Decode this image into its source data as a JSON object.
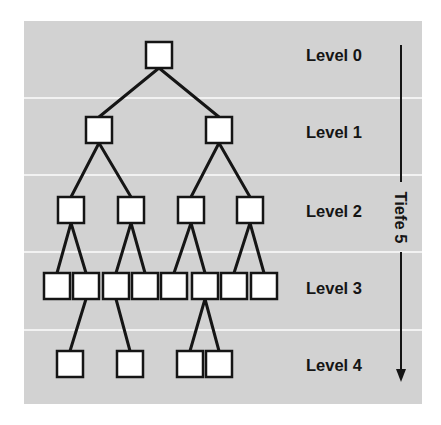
{
  "diagram": {
    "type": "tree",
    "colors": {
      "background": "#ffffff",
      "panel": "#d2d2d2",
      "separator": "#f2f2f2",
      "node_fill": "#ffffff",
      "stroke": "#151515"
    },
    "levels": [
      {
        "label": "Level 0"
      },
      {
        "label": "Level 1"
      },
      {
        "label": "Level 2"
      },
      {
        "label": "Level 3"
      },
      {
        "label": "Level 4"
      }
    ],
    "depth_indicator": {
      "label": "Tiefe 5",
      "direction": "down"
    },
    "nodes": [
      {
        "id": "n0",
        "level": 0,
        "cx": 159,
        "cy": 55
      },
      {
        "id": "n1a",
        "level": 1,
        "cx": 99,
        "cy": 130,
        "parent": "n0"
      },
      {
        "id": "n1b",
        "level": 1,
        "cx": 219,
        "cy": 130,
        "parent": "n0"
      },
      {
        "id": "n2a",
        "level": 2,
        "cx": 71,
        "cy": 210,
        "parent": "n1a"
      },
      {
        "id": "n2b",
        "level": 2,
        "cx": 131,
        "cy": 210,
        "parent": "n1a"
      },
      {
        "id": "n2c",
        "level": 2,
        "cx": 191,
        "cy": 210,
        "parent": "n1b"
      },
      {
        "id": "n2d",
        "level": 2,
        "cx": 250,
        "cy": 210,
        "parent": "n1b"
      },
      {
        "id": "n3a",
        "level": 3,
        "cx": 57,
        "cy": 286,
        "parent": "n2a"
      },
      {
        "id": "n3b",
        "level": 3,
        "cx": 86,
        "cy": 286,
        "parent": "n2a"
      },
      {
        "id": "n3c",
        "level": 3,
        "cx": 116,
        "cy": 286,
        "parent": "n2b"
      },
      {
        "id": "n3d",
        "level": 3,
        "cx": 145,
        "cy": 286,
        "parent": "n2b"
      },
      {
        "id": "n3e",
        "level": 3,
        "cx": 174,
        "cy": 286,
        "parent": "n2c"
      },
      {
        "id": "n3f",
        "level": 3,
        "cx": 205,
        "cy": 286,
        "parent": "n2c"
      },
      {
        "id": "n3g",
        "level": 3,
        "cx": 234,
        "cy": 286,
        "parent": "n2d"
      },
      {
        "id": "n3h",
        "level": 3,
        "cx": 264,
        "cy": 286,
        "parent": "n2d"
      },
      {
        "id": "n4a",
        "level": 4,
        "cx": 70,
        "cy": 364,
        "parent": "n3b"
      },
      {
        "id": "n4b",
        "level": 4,
        "cx": 130,
        "cy": 364,
        "parent": "n3c"
      },
      {
        "id": "n4c",
        "level": 4,
        "cx": 190,
        "cy": 364,
        "parent": "n3f"
      },
      {
        "id": "n4d",
        "level": 4,
        "cx": 219,
        "cy": 364,
        "parent": "n3f"
      }
    ]
  }
}
